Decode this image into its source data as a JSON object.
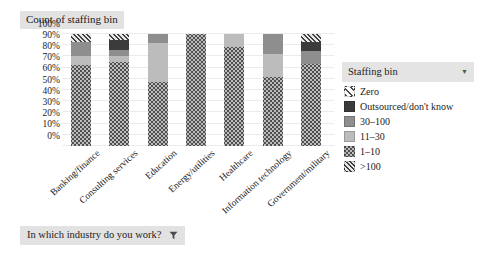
{
  "chart_title": "Count of staffing bin",
  "legend": {
    "header_label": "Staffing bin",
    "caret_icon": "chevron-down-icon",
    "items": [
      {
        "label": "Zero",
        "key": "zero",
        "color": "#e9e9e9",
        "pattern": "diagonal-hatch"
      },
      {
        "label": "Outsourced/don't know",
        "key": "outsourced",
        "color": "#3b3b3b",
        "pattern": "solid"
      },
      {
        "label": "30–100",
        "key": "b30_100",
        "color": "#8e8e8e",
        "pattern": "solid"
      },
      {
        "label": "11–30",
        "key": "b11_30",
        "color": "#bcbcbc",
        "pattern": "solid"
      },
      {
        "label": "1–10",
        "key": "b1_10",
        "color": "#bdbdbd",
        "pattern": "dotted"
      },
      {
        "label": ">100",
        "key": "b100plus",
        "color": "#d8d8d8",
        "pattern": "dense-diagonal-hatch"
      }
    ]
  },
  "filter": {
    "label": "In which industry do you work?",
    "icon": "filter-funnel-icon"
  },
  "chart_data": {
    "type": "bar",
    "subtype": "stacked-100-percent",
    "title": "Count of staffing bin",
    "xlabel": "",
    "ylabel": "",
    "ylim": [
      0,
      100
    ],
    "yticks": [
      "0%",
      "10%",
      "20%",
      "30%",
      "40%",
      "50%",
      "60%",
      "70%",
      "80%",
      "90%",
      "100%"
    ],
    "grid": true,
    "legend_position": "right",
    "legend_title": "Staffing bin",
    "categories": [
      "Banking/finance",
      "Consulting services",
      "Education",
      "Energy/utilities",
      "Healthcare",
      "Information technology",
      "Government/military"
    ],
    "series": [
      {
        "name": "1–10",
        "key": "b1_10",
        "values": [
          72,
          75,
          57,
          100,
          88,
          62,
          73
        ]
      },
      {
        "name": "11–30",
        "key": "b11_30",
        "values": [
          8,
          5,
          35,
          0,
          12,
          20,
          0
        ]
      },
      {
        "name": "30–100",
        "key": "b30_100",
        "values": [
          13,
          6,
          8,
          0,
          0,
          18,
          12
        ]
      },
      {
        "name": "Outsourced/don't know",
        "key": "outsourced",
        "values": [
          0,
          9,
          0,
          0,
          0,
          0,
          8
        ]
      },
      {
        "name": ">100",
        "key": "b100plus",
        "values": [
          7,
          5,
          0,
          0,
          0,
          0,
          7
        ]
      },
      {
        "name": "Zero",
        "key": "zero",
        "values": [
          0,
          0,
          0,
          0,
          0,
          0,
          0
        ]
      }
    ],
    "stack_order_bottom_to_top": [
      "b1_10",
      "b11_30",
      "b30_100",
      "outsourced",
      "b100plus",
      "zero"
    ]
  }
}
